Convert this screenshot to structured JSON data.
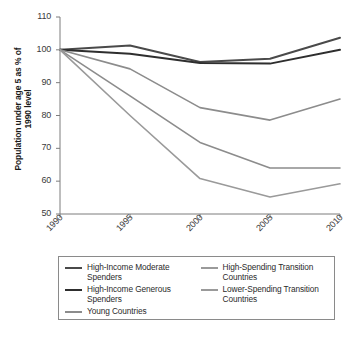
{
  "chart_data": {
    "type": "line",
    "title": "",
    "xlabel": "",
    "ylabel": "Population under age 5 as % of 1990 level",
    "ylabel_line1": "Population under age 5 as % of",
    "ylabel_line2": "1990 level",
    "x": [
      1990,
      1995,
      2000,
      2005,
      2010
    ],
    "categories": [
      "1990",
      "1995",
      "2000",
      "2005",
      "2010"
    ],
    "xtick_labels": [
      "1990",
      "1995",
      "2000",
      "2005",
      "2010"
    ],
    "ytick_labels": [
      "110",
      "100",
      "90",
      "80",
      "70",
      "60",
      "50"
    ],
    "ytick_values": [
      110,
      100,
      90,
      80,
      70,
      60,
      50
    ],
    "ylim": [
      50,
      110
    ],
    "xlim": [
      1990,
      2010
    ],
    "grid": false,
    "legend_position": "below",
    "series": [
      {
        "name": "High-Income Moderate Spenders",
        "color": "#4a4a4a",
        "width": 2.0,
        "values": [
          100,
          101.3,
          96.3,
          97.3,
          103.7
        ]
      },
      {
        "name": "High-Income Generous Spenders",
        "color": "#2e2e2e",
        "width": 2.0,
        "values": [
          100,
          98.8,
          96.0,
          95.8,
          100.0
        ]
      },
      {
        "name": "Young Countries",
        "color": "#8c8c8c",
        "width": 1.6,
        "values": [
          100,
          94.2,
          82.4,
          78.6,
          85.0
        ]
      },
      {
        "name": "High-Spending Transition Countries",
        "color": "#8c8c8c",
        "width": 1.6,
        "values": [
          100,
          86.0,
          71.8,
          64.0,
          64.0
        ]
      },
      {
        "name": "Lower-Spending Transition Countries",
        "color": "#9a9a9a",
        "width": 1.6,
        "values": [
          100,
          80.0,
          60.8,
          55.2,
          59.2
        ]
      }
    ]
  },
  "legend": {
    "columns": [
      {
        "entries": [
          {
            "label": "High-Income Moderate Spenders",
            "color": "#4a4a4a"
          },
          {
            "label": "High-Income Generous Spenders",
            "color": "#2e2e2e"
          },
          {
            "label": "Young Countries",
            "color": "#8c8c8c"
          }
        ]
      },
      {
        "entries": [
          {
            "label": "High-Spending Transition Countries",
            "color": "#9a9a9a"
          },
          {
            "label": "Lower-Spending Transition Countries",
            "color": "#9a9a9a"
          }
        ]
      }
    ]
  },
  "axes": {
    "axis_color": "#7d7d7d",
    "tick_color": "#7d7d7d"
  }
}
